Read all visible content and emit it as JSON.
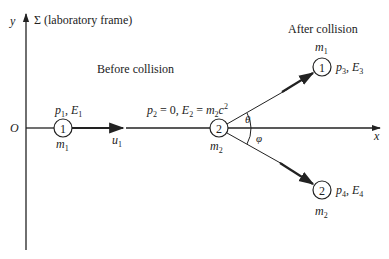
{
  "axes": {
    "y_label": "y",
    "frame_label": "Σ (laboratory frame)",
    "origin_label": "O",
    "x_label": "x"
  },
  "before": {
    "title": "Before collision",
    "particle1": {
      "number": "1",
      "momentum": "p",
      "momentum_sub": "1",
      "energy": "E",
      "energy_sub": "1",
      "mass": "m",
      "mass_sub": "1",
      "velocity": "u",
      "velocity_sub": "1"
    },
    "particle2": {
      "number": "2",
      "momentum_text": "p",
      "momentum_sub": "2",
      "eq1": " = 0, ",
      "energy": "E",
      "energy_sub": "2",
      "eq2": " = ",
      "mass": "m",
      "mass_sub": "2",
      "c": "c",
      "c_sup": "2"
    }
  },
  "after": {
    "title": "After collision",
    "particle3": {
      "number": "1",
      "mass": "m",
      "mass_sub": "1",
      "momentum": "p",
      "momentum_sub": "3",
      "energy": "E",
      "energy_sub": "3"
    },
    "particle4": {
      "number": "2",
      "mass": "m",
      "mass_sub": "2",
      "momentum": "p",
      "momentum_sub": "4",
      "energy": "E",
      "energy_sub": "4"
    }
  },
  "angles": {
    "theta": "θ",
    "phi": "φ"
  }
}
